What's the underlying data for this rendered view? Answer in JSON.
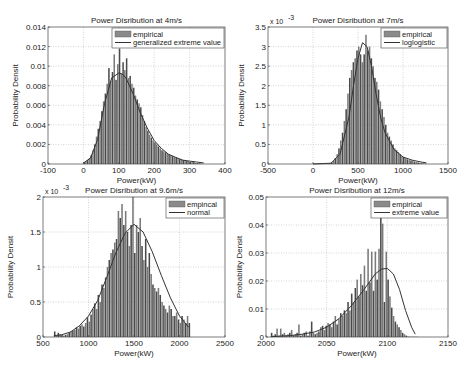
{
  "chart_data": [
    {
      "type": "bar",
      "title": "Power Disribution at 4m/s",
      "xlabel": "Power(kW)",
      "ylabel": "Probability Densit",
      "xlim": [
        -100,
        400
      ],
      "ylim": [
        0,
        0.014
      ],
      "xticks": [
        -100,
        0,
        100,
        200,
        300,
        400
      ],
      "xtick_labels": [
        "-100",
        "0",
        "100",
        "200",
        "300",
        "400"
      ],
      "yticks": [
        0,
        0.002,
        0.004,
        0.006,
        0.008,
        0.01,
        0.012,
        0.014
      ],
      "ytick_labels": [
        "0",
        "0.002",
        "0.004",
        "0.006",
        "0.008",
        "0.01",
        "0.012",
        "0.014"
      ],
      "y_exponent_label": "",
      "grid": true,
      "legend": {
        "placement": "top-right",
        "entries": [
          "empirical",
          "generalized extreme value"
        ]
      },
      "histogram": {
        "bin_start": 0,
        "bin_width": 5,
        "values": [
          0.0002,
          0.0003,
          0.0004,
          0.0006,
          0.0009,
          0.0014,
          0.002,
          0.0028,
          0.0036,
          0.0044,
          0.0054,
          0.0064,
          0.0072,
          0.0082,
          0.0098,
          0.0085,
          0.0094,
          0.0112,
          0.0086,
          0.0102,
          0.0118,
          0.0092,
          0.0104,
          0.0096,
          0.0108,
          0.0088,
          0.009,
          0.0082,
          0.0078,
          0.007,
          0.0066,
          0.0062,
          0.0058,
          0.005,
          0.0044,
          0.0038,
          0.0034,
          0.003,
          0.0027,
          0.0024,
          0.0022,
          0.002,
          0.0018,
          0.0016,
          0.0014,
          0.0013,
          0.0012,
          0.0011,
          0.001,
          0.0009,
          0.0008,
          0.0007,
          0.0007,
          0.0006,
          0.0005,
          0.0005,
          0.0004,
          0.0004,
          0.0003,
          0.0003,
          0.0002,
          0.0002,
          0.0002,
          0.0001,
          0.0001,
          0.0001,
          5e-05
        ]
      },
      "fit": {
        "name": "generalized extreme value",
        "x": [
          0,
          20,
          40,
          60,
          80,
          100,
          110,
          120,
          140,
          160,
          180,
          200,
          220,
          240,
          260,
          280,
          300,
          320,
          340
        ],
        "y": [
          0.0001,
          0.0006,
          0.0025,
          0.0062,
          0.0088,
          0.0093,
          0.0092,
          0.0088,
          0.0072,
          0.0053,
          0.0037,
          0.0024,
          0.0016,
          0.001,
          0.0007,
          0.0004,
          0.0003,
          0.0002,
          0.0001
        ]
      }
    },
    {
      "type": "bar",
      "title": "Power Disribution at 7m/s",
      "xlabel": "Power(kW)",
      "ylabel": "Probability Densit",
      "xlim": [
        -500,
        1500
      ],
      "ylim": [
        0,
        0.0035
      ],
      "xticks": [
        -500,
        0,
        500,
        1000,
        1500
      ],
      "xtick_labels": [
        "-500",
        "0",
        "500",
        "1000",
        "1500"
      ],
      "yticks": [
        0,
        0.0005,
        0.001,
        0.0015,
        0.002,
        0.0025,
        0.003,
        0.0035
      ],
      "ytick_labels": [
        "0",
        "0.5",
        "1",
        "1.5",
        "2",
        "2.5",
        "3",
        "3.5"
      ],
      "y_exponent_label": "x 10",
      "y_exponent_power": "-3",
      "grid": true,
      "legend": {
        "placement": "top-right",
        "entries": [
          "empirical",
          "loglogistic"
        ]
      },
      "histogram": {
        "bin_start": 0,
        "bin_width": 20,
        "values": [
          1e-05,
          1e-05,
          1e-05,
          1e-05,
          1e-05,
          1e-05,
          1e-05,
          1e-05,
          1e-05,
          2e-05,
          4e-05,
          8e-05,
          0.00015,
          0.00025,
          0.0004,
          0.0006,
          0.0008,
          0.0011,
          0.0014,
          0.0018,
          0.0022,
          0.0024,
          0.0026,
          0.0027,
          0.0029,
          0.003,
          0.0028,
          0.0026,
          0.0028,
          0.0033,
          0.0029,
          0.003,
          0.0027,
          0.0025,
          0.0022,
          0.0021,
          0.0019,
          0.0016,
          0.0014,
          0.0012,
          0.001,
          0.0008,
          0.0007,
          0.0006,
          0.0005,
          0.0004,
          0.00035,
          0.0003,
          0.00025,
          0.0002,
          0.00018,
          0.00015,
          0.00012,
          0.0001,
          9e-05,
          8e-05,
          6e-05,
          5e-05,
          4e-05,
          3e-05,
          2e-05,
          2e-05,
          1e-05
        ]
      },
      "fit": {
        "name": "loglogistic",
        "x": [
          0,
          200,
          300,
          400,
          450,
          500,
          550,
          600,
          650,
          700,
          750,
          800,
          900,
          1000,
          1100,
          1200,
          1260
        ],
        "y": [
          0,
          2e-05,
          0.00025,
          0.0012,
          0.002,
          0.0027,
          0.0031,
          0.003,
          0.0025,
          0.0018,
          0.0012,
          0.0008,
          0.00037,
          0.00018,
          0.0001,
          5e-05,
          3e-05
        ]
      }
    },
    {
      "type": "bar",
      "title": "Power Disribution at 9.6m/s",
      "xlabel": "Power(kW)",
      "ylabel": "Probability Densit",
      "xlim": [
        500,
        2500
      ],
      "ylim": [
        0,
        0.002
      ],
      "xticks": [
        500,
        1000,
        1500,
        2000,
        2500
      ],
      "xtick_labels": [
        "500",
        "1000",
        "1500",
        "2000",
        "2500"
      ],
      "yticks": [
        0,
        0.0005,
        0.001,
        0.0015,
        0.002
      ],
      "ytick_labels": [
        "0",
        "0.5",
        "1",
        "1.5",
        "2"
      ],
      "y_exponent_label": "x 10",
      "y_exponent_power": "-3",
      "grid": true,
      "legend": {
        "placement": "top-right",
        "entries": [
          "empincal",
          "normal"
        ]
      },
      "histogram": {
        "bin_start": 620,
        "bin_width": 20,
        "values": [
          8e-05,
          2e-05,
          6e-05,
          4e-05,
          3e-05,
          2e-05,
          3e-05,
          4e-05,
          6e-05,
          8e-05,
          9e-05,
          0.0001,
          0.00014,
          0.00012,
          0.00016,
          0.00018,
          0.00015,
          0.0002,
          0.00028,
          0.00022,
          0.00032,
          0.0004,
          0.00048,
          0.0004,
          0.0006,
          0.0005,
          0.00075,
          0.0007,
          0.00085,
          0.001,
          0.0011,
          0.0012,
          0.00125,
          0.00135,
          0.0014,
          0.0018,
          0.0017,
          0.0019,
          0.0016,
          0.0018,
          0.0015,
          0.0013,
          0.0016,
          0.002,
          0.0012,
          0.0016,
          0.0015,
          0.0017,
          0.0013,
          0.0011,
          0.0014,
          0.001,
          0.0012,
          0.0009,
          0.00075,
          0.0007,
          0.00065,
          0.0007,
          0.0006,
          0.0005,
          0.00045,
          0.0004,
          0.00035,
          0.00045,
          0.0004,
          0.0003,
          0.0003,
          0.00035,
          0.00025,
          0.0002,
          0.0003,
          0.00025,
          0.0002,
          0.0003,
          0.0002
        ]
      },
      "fit": {
        "name": "normal",
        "x": [
          620,
          700,
          800,
          900,
          1000,
          1100,
          1200,
          1300,
          1400,
          1500,
          1600,
          1700,
          1800,
          1900,
          2000,
          2100
        ],
        "y": [
          2e-05,
          3e-05,
          7e-05,
          0.00016,
          0.0003,
          0.00052,
          0.00085,
          0.0012,
          0.00148,
          0.00161,
          0.0015,
          0.00122,
          0.00088,
          0.00056,
          0.0003,
          0.00014
        ]
      }
    },
    {
      "type": "bar",
      "title": "Power Disribution at 12m/s",
      "xlabel": "Power(kW)",
      "ylabel": "Probability Densit",
      "xlim": [
        2000,
        2150
      ],
      "ylim": [
        0,
        0.05
      ],
      "xticks": [
        2000,
        2050,
        2100,
        2150
      ],
      "xtick_labels": [
        "2000",
        "2050",
        "2100",
        "2150"
      ],
      "yticks": [
        0,
        0.01,
        0.02,
        0.03,
        0.04,
        0.05
      ],
      "ytick_labels": [
        "0",
        "0.01",
        "0.02",
        "0.03",
        "0.04",
        "0.05"
      ],
      "y_exponent_label": "",
      "grid": true,
      "legend": {
        "placement": "top-right",
        "entries": [
          "empirical",
          "extreme value"
        ]
      },
      "histogram": {
        "bin_start": 2004,
        "bin_width": 1.5,
        "values": [
          0.0015,
          0.0005,
          0.001,
          0.003,
          0.0005,
          0.003,
          0.001,
          0.0015,
          0.0005,
          0.001,
          0.0015,
          0.0025,
          0.0005,
          0.001,
          0.0015,
          0.0045,
          0.0005,
          0.001,
          0.0015,
          0.002,
          0.0005,
          0.002,
          0.0055,
          0.0015,
          0.001,
          0.0015,
          0.002,
          0.0035,
          0.004,
          0.0025,
          0.004,
          0.005,
          0.0045,
          0.0035,
          0.0055,
          0.0075,
          0.0045,
          0.0065,
          0.0085,
          0.0075,
          0.0095,
          0.0085,
          0.0125,
          0.0095,
          0.0155,
          0.0125,
          0.0175,
          0.0205,
          0.0145,
          0.0225,
          0.0185,
          0.0255,
          0.0165,
          0.0315,
          0.0195,
          0.0305,
          0.0165,
          0.0305,
          0.0205,
          0.0315,
          0.0455,
          0.0405,
          0.0125,
          0.0305,
          0.0205,
          0.0145,
          0.0105,
          0.0075,
          0.0055,
          0.0045,
          0.0035,
          0.0025,
          0.0015,
          0.001,
          0.0005,
          0.0002,
          0.0001,
          0.0001,
          0.0001,
          0.0001,
          0.0001
        ]
      },
      "fit": {
        "name": "extreme value",
        "x": [
          2004,
          2020,
          2030,
          2040,
          2050,
          2060,
          2070,
          2080,
          2090,
          2095,
          2100,
          2105,
          2110,
          2115,
          2120,
          2123
        ],
        "y": [
          0.0001,
          0.0005,
          0.001,
          0.0018,
          0.0035,
          0.0065,
          0.011,
          0.0165,
          0.0225,
          0.0242,
          0.0245,
          0.0225,
          0.017,
          0.0095,
          0.0035,
          0.001
        ]
      }
    }
  ]
}
